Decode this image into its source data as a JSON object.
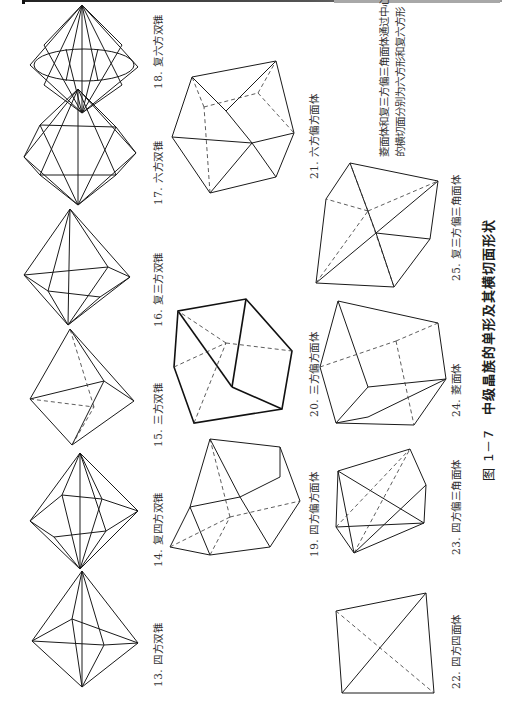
{
  "figure": {
    "number": "图 1－7",
    "title": "中级晶族的单形及其横切面形状"
  },
  "note": {
    "line1": "菱面体和复三方偏三角面体通过中心",
    "line2": "的横切面分别为六方形和复六方形"
  },
  "forms": [
    {
      "id": 13,
      "label": "13. 四方双锥"
    },
    {
      "id": 14,
      "label": "14. 复四方双锥"
    },
    {
      "id": 15,
      "label": "15. 三方双锥"
    },
    {
      "id": 16,
      "label": "16. 复三方双锥"
    },
    {
      "id": 17,
      "label": "17. 六方双锥"
    },
    {
      "id": 18,
      "label": "18. 复六方双锥"
    },
    {
      "id": 19,
      "label": "19. 四方偏方面体"
    },
    {
      "id": 20,
      "label": "20. 三方偏方面体"
    },
    {
      "id": 21,
      "label": "21. 六方偏方面体"
    },
    {
      "id": 22,
      "label": "22. 四方四面体"
    },
    {
      "id": 23,
      "label": "23. 四方偏三角面体"
    },
    {
      "id": 24,
      "label": "24. 菱面体"
    },
    {
      "id": 25,
      "label": "25. 复三方偏三角面体"
    }
  ]
}
